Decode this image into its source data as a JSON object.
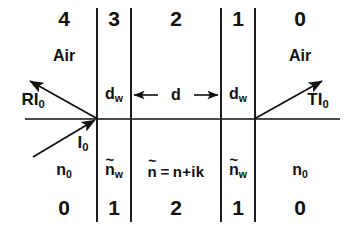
{
  "figure": {
    "kind": "optical-thin-film-layer-diagram"
  },
  "axis": {
    "label": "optical-axis"
  },
  "interfaces": [
    {
      "name": "interface-left-outer",
      "x": 97
    },
    {
      "name": "interface-left-inner",
      "x": 131
    },
    {
      "name": "interface-right-inner",
      "x": 221
    },
    {
      "name": "interface-right-outer",
      "x": 255
    }
  ],
  "top_numbers": [
    {
      "value": "4",
      "x": 64
    },
    {
      "value": "3",
      "x": 114
    },
    {
      "value": "2",
      "x": 176
    },
    {
      "value": "1",
      "x": 238
    },
    {
      "value": "0",
      "x": 300
    }
  ],
  "bottom_numbers": [
    {
      "value": "0",
      "x": 64
    },
    {
      "value": "1",
      "x": 114
    },
    {
      "value": "2",
      "x": 176
    },
    {
      "value": "1",
      "x": 238
    },
    {
      "value": "0",
      "x": 300
    }
  ],
  "media_names": [
    {
      "value": "Air",
      "x": 64
    },
    {
      "value": "Air",
      "x": 300
    }
  ],
  "indices": {
    "outer_left": {
      "base": "n",
      "subscript": "0",
      "x": 64
    },
    "window_left": {
      "tilde": "~",
      "base": "n",
      "subscript": "w",
      "x": 114
    },
    "outer_right": {
      "base": "n",
      "subscript": "0",
      "x": 300
    },
    "window_right": {
      "tilde": "~",
      "base": "n",
      "subscript": "w",
      "x": 238
    },
    "film": {
      "tilde": "~",
      "base": "n",
      "equals": "=",
      "expression": "n+ik",
      "x": 176
    }
  },
  "thickness_labels": [
    {
      "base": "d",
      "subscript": "w",
      "x": 114,
      "name": "window-thickness-left"
    },
    {
      "base": "d",
      "subscript": "",
      "x": 176,
      "name": "film-thickness"
    },
    {
      "base": "d",
      "subscript": "w",
      "x": 238,
      "name": "window-thickness-right"
    }
  ],
  "rays": [
    {
      "name": "reflected-ray",
      "label_base": "RI",
      "label_sub": "0",
      "label_x": 33,
      "label_y": 101
    },
    {
      "name": "incident-ray",
      "label_base": "I",
      "label_sub": "0",
      "label_x": 83,
      "label_y": 144
    },
    {
      "name": "transmitted-ray",
      "label_base": "TI",
      "label_sub": "0",
      "label_x": 318,
      "label_y": 101
    }
  ],
  "colors": {
    "ink": "#111111",
    "background": "#ffffff"
  }
}
